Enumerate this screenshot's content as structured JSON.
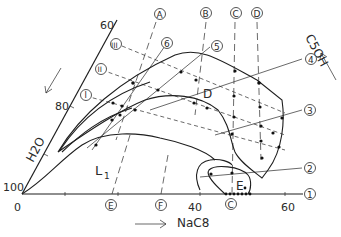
{
  "figure": {
    "type": "ternary-phase-diagram-section",
    "components": {
      "bottom": "NaC8",
      "left": "H2O",
      "right": "C5OH"
    },
    "bottom_axis": {
      "label": "NaC8",
      "ticks": [
        "0",
        "40",
        "60"
      ],
      "direction_arrow": "→"
    },
    "left_axis": {
      "label": "H2O",
      "ticks": [
        "60",
        "80",
        "100"
      ]
    },
    "right_label": "C5OH",
    "regions": {
      "L1": "L",
      "L1_sub": "1",
      "D": "D",
      "E": "E"
    },
    "vertical_line_labels": [
      "A",
      "B",
      "C",
      "D"
    ],
    "bottom_markers": [
      "E",
      "F",
      "C"
    ],
    "dilution_line_labels": [
      "I",
      "II",
      "III"
    ],
    "numbered_line_labels": [
      "1",
      "2",
      "3",
      "4",
      "5",
      "6"
    ]
  }
}
